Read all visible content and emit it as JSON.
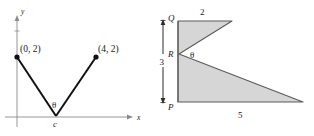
{
  "figure": {
    "left_diagram": {
      "name": "v-shape-on-axes",
      "axis_x_label": "x",
      "axis_y_label": "y",
      "point_left_label": "(0, 2)",
      "point_right_label": "(4, 2)",
      "vertex_label": "c",
      "angle_label": "θ",
      "line_color": "#111111",
      "axis_color": "#8a8a8a",
      "point_color": "#111111"
    },
    "right_diagram": {
      "name": "shaded-polygon-with-angle",
      "vertex_top_label": "Q",
      "vertex_mid_label": "R",
      "vertex_bottom_label": "P",
      "angle_label": "θ",
      "dim_top_label": "2",
      "dim_left_label": "3",
      "dim_bottom_label": "5",
      "fill_color": "#d6d6d6",
      "stroke_color": "#5a5a5a",
      "dim_color": "#2b2b2b"
    }
  }
}
